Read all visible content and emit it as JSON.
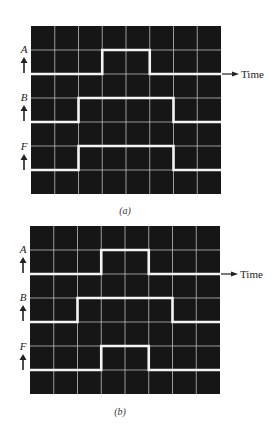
{
  "figure": {
    "panels": [
      {
        "id": "a",
        "caption": "(a)",
        "grid": {
          "columns": 8,
          "rows": 7
        },
        "time_label": "Time",
        "signals": [
          {
            "name": "A",
            "baseline_row": 2,
            "high_row": 1,
            "high_from_col": 3,
            "high_to_col": 5
          },
          {
            "name": "B",
            "baseline_row": 4,
            "high_row": 3,
            "high_from_col": 2,
            "high_to_col": 6
          },
          {
            "name": "F",
            "baseline_row": 6,
            "high_row": 5,
            "high_from_col": 2,
            "high_to_col": 6
          }
        ]
      },
      {
        "id": "b",
        "caption": "(b)",
        "grid": {
          "columns": 8,
          "rows": 7
        },
        "time_label": "Time",
        "signals": [
          {
            "name": "A",
            "baseline_row": 2,
            "high_row": 1,
            "high_from_col": 3,
            "high_to_col": 5
          },
          {
            "name": "B",
            "baseline_row": 4,
            "high_row": 3,
            "high_from_col": 2,
            "high_to_col": 6
          },
          {
            "name": "F",
            "baseline_row": 6,
            "high_row": 5,
            "high_from_col": 3,
            "high_to_col": 5
          }
        ]
      }
    ],
    "colors": {
      "screen_background": "#161616",
      "grid_line": "#bdbdbd",
      "waveform": "#f4f4f4",
      "text": "#222222"
    }
  }
}
